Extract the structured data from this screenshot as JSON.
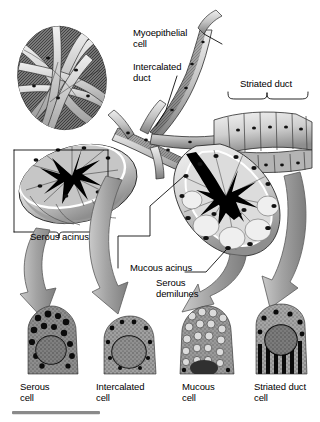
{
  "figure": {
    "title_alt": "Salivary gland secretory unit",
    "background": "#ffffff",
    "arrow_color": "#9e9e9e",
    "arrow_stroke": "#5a5a5a",
    "line_color": "#000000",
    "tissue_light": "#d8d8d8",
    "tissue_mid": "#a8a8a8",
    "tissue_dark": "#6e6e6e",
    "nucleus_color": "#111111"
  },
  "labels": {
    "myoepithelial_cell": "Myoepithelial\ncell",
    "intercalated_duct": "Intercalated\nduct",
    "striated_duct": "Striated duct",
    "serous_acinus": "Serous acinus",
    "mucous_acinus": "Mucous acinus",
    "serous_demilunes": "Serous\ndemilunes"
  },
  "micrographs": [
    {
      "id": "serous-cell",
      "caption": "Serous\ncell",
      "x": 20,
      "y": 306
    },
    {
      "id": "intercalated-cell",
      "caption": "Intercalated\ncell",
      "x": 96,
      "y": 316
    },
    {
      "id": "mucous-cell",
      "caption": "Mucous\ncell",
      "x": 176,
      "y": 306
    },
    {
      "id": "striated-duct-cell",
      "caption": "Striated duct\ncell",
      "x": 252,
      "y": 304
    }
  ],
  "scale_bar": {
    "x": 12,
    "y": 411,
    "width": 88,
    "color": "#8a8a8a"
  }
}
